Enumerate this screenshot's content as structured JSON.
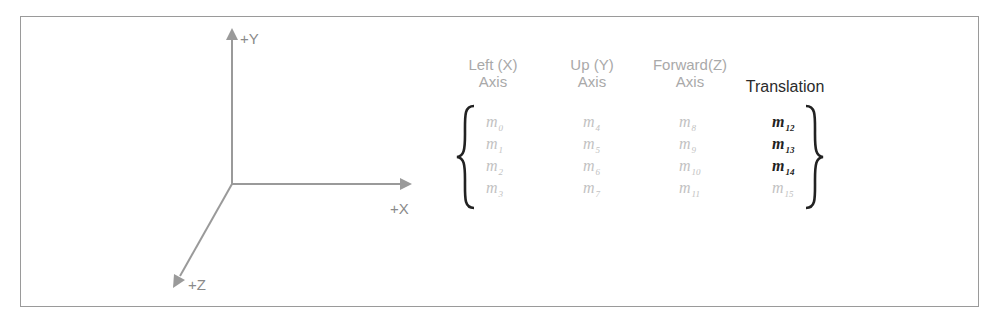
{
  "diagram": {
    "axes": {
      "y_label": "+Y",
      "x_label": "+X",
      "z_label": "+Z",
      "color": "#9a9a9a"
    },
    "matrix": {
      "columns": [
        {
          "header_line1": "Left (X)",
          "header_line2": "Axis",
          "cells": [
            "m",
            "m",
            "m",
            "m"
          ],
          "subs": [
            "0",
            "1",
            "2",
            "3"
          ],
          "emphasis": [
            false,
            false,
            false,
            false
          ]
        },
        {
          "header_line1": "Up (Y)",
          "header_line2": "Axis",
          "cells": [
            "m",
            "m",
            "m",
            "m"
          ],
          "subs": [
            "4",
            "5",
            "6",
            "7"
          ],
          "emphasis": [
            false,
            false,
            false,
            false
          ]
        },
        {
          "header_line1": "Forward(Z)",
          "header_line2": "Axis",
          "cells": [
            "m",
            "m",
            "m",
            "m"
          ],
          "subs": [
            "8",
            "9",
            "10",
            "11"
          ],
          "emphasis": [
            false,
            false,
            false,
            false
          ]
        },
        {
          "header_line1": "",
          "header_line2": "Translation",
          "cells": [
            "m",
            "m",
            "m",
            "m"
          ],
          "subs": [
            "12",
            "13",
            "14",
            "15"
          ],
          "emphasis": [
            true,
            true,
            true,
            false
          ]
        }
      ],
      "muted_color": "#c2c2c2",
      "emphasis_color": "#222222"
    }
  }
}
